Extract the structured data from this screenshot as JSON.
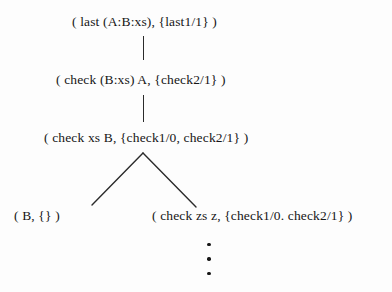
{
  "diagram": {
    "type": "derivation-tree",
    "title": "",
    "background_color": "#fdfdfd",
    "text_color": "#161616",
    "edge_color": "#2b2b2b",
    "nodes": [
      {
        "id": "root",
        "label": "( last (A:B:xs), {last1/1} )",
        "level": 0
      },
      {
        "id": "check2",
        "label": "( check (B:xs) A, {check2/1} )",
        "level": 1
      },
      {
        "id": "check1",
        "label": "( check xs B, {check1/0, check2/1} )",
        "level": 2
      },
      {
        "id": "leaf-b",
        "label": "( B, {} )",
        "level": 3
      },
      {
        "id": "check-zs",
        "label": "( check zs z, {check1/0. check2/1} )",
        "level": 3
      }
    ],
    "edges": [
      {
        "from": "root",
        "to": "check2",
        "style": "vertical"
      },
      {
        "from": "check2",
        "to": "check1",
        "style": "vertical"
      },
      {
        "from": "check1",
        "to": "leaf-b",
        "style": "diagonal-left"
      },
      {
        "from": "check1",
        "to": "check-zs",
        "style": "diagonal-right"
      }
    ],
    "continuation": {
      "under_node": "check-zs",
      "symbol": "vertical-ellipsis",
      "dot_count": 3
    }
  }
}
